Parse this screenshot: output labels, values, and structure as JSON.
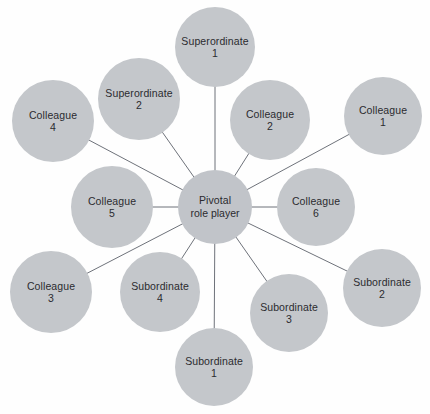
{
  "diagram": {
    "type": "radial-network",
    "title": "",
    "canvas": {
      "width": 430,
      "height": 414
    },
    "style": {
      "background": "#fefefe",
      "node_fill": "#c4c7cb",
      "central_fill": "#c1c4c9",
      "link_color": "#5e626b",
      "text_color": "#2b2b2f"
    },
    "central": {
      "id": "pivotal",
      "line1": "Pivotal",
      "line2": "role player",
      "cx": 215,
      "cy": 207,
      "r": 37
    },
    "nodes": [
      {
        "id": "superordinate-1",
        "line1": "Superordinate",
        "line2": "1",
        "cx": 215,
        "cy": 47,
        "r": 40
      },
      {
        "id": "superordinate-2",
        "line1": "Superordinate",
        "line2": "2",
        "cx": 139,
        "cy": 99,
        "r": 41
      },
      {
        "id": "colleague-4",
        "line1": "Colleague",
        "line2": "4",
        "cx": 53,
        "cy": 121,
        "r": 41
      },
      {
        "id": "colleague-2",
        "line1": "Colleague",
        "line2": "2",
        "cx": 270,
        "cy": 120,
        "r": 40
      },
      {
        "id": "colleague-1",
        "line1": "Colleague",
        "line2": "1",
        "cx": 383,
        "cy": 116,
        "r": 39
      },
      {
        "id": "colleague-5",
        "line1": "Colleague",
        "line2": "5",
        "cx": 112,
        "cy": 207,
        "r": 41
      },
      {
        "id": "colleague-6",
        "line1": "Colleague",
        "line2": "6",
        "cx": 316,
        "cy": 207,
        "r": 39
      },
      {
        "id": "colleague-3",
        "line1": "Colleague",
        "line2": "3",
        "cx": 51,
        "cy": 292,
        "r": 41
      },
      {
        "id": "subordinate-4",
        "line1": "Subordinate",
        "line2": "4",
        "cx": 160,
        "cy": 292,
        "r": 40
      },
      {
        "id": "subordinate-3",
        "line1": "Subordinate",
        "line2": "3",
        "cx": 289,
        "cy": 313,
        "r": 39
      },
      {
        "id": "subordinate-2",
        "line1": "Subordinate",
        "line2": "2",
        "cx": 382,
        "cy": 288,
        "r": 39
      },
      {
        "id": "subordinate-1",
        "line1": "Subordinate",
        "line2": "1",
        "cx": 214,
        "cy": 367,
        "r": 39
      }
    ],
    "links": [
      {
        "from": "pivotal",
        "to": "superordinate-1"
      },
      {
        "from": "pivotal",
        "to": "superordinate-2"
      },
      {
        "from": "pivotal",
        "to": "colleague-4"
      },
      {
        "from": "pivotal",
        "to": "colleague-2"
      },
      {
        "from": "pivotal",
        "to": "colleague-1"
      },
      {
        "from": "pivotal",
        "to": "colleague-5"
      },
      {
        "from": "pivotal",
        "to": "colleague-6"
      },
      {
        "from": "pivotal",
        "to": "colleague-3"
      },
      {
        "from": "pivotal",
        "to": "subordinate-4"
      },
      {
        "from": "pivotal",
        "to": "subordinate-3"
      },
      {
        "from": "pivotal",
        "to": "subordinate-2"
      },
      {
        "from": "pivotal",
        "to": "subordinate-1"
      }
    ]
  }
}
